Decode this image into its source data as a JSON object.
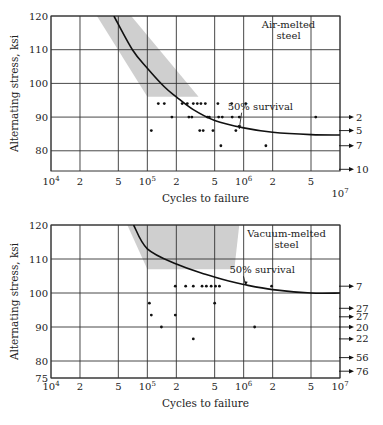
{
  "chart_data": [
    {
      "type": "scatter",
      "title": "Air-melted steel",
      "panel_label_lines": [
        "Air-melted",
        "steel"
      ],
      "xlabel": "Cycles to failure",
      "ylabel": "Alternating stress, ksi",
      "xscale": "log",
      "xlim": [
        10000,
        10000000
      ],
      "ylim": [
        74,
        120
      ],
      "x_ticks": [
        10000,
        20000,
        50000,
        100000,
        200000,
        500000,
        1000000,
        2000000,
        5000000,
        10000000
      ],
      "x_tick_labels": [
        {
          "base": "10",
          "exp": "4"
        },
        {
          "base": "2"
        },
        {
          "base": "5"
        },
        {
          "base": "10",
          "exp": "5"
        },
        {
          "base": "2"
        },
        {
          "base": "5"
        },
        {
          "base": "10",
          "exp": "6"
        },
        {
          "base": "2"
        },
        {
          "base": "5"
        },
        {
          "base": "10",
          "exp": "7"
        }
      ],
      "y_ticks": [
        80,
        90,
        100,
        110,
        120
      ],
      "grid": true,
      "scatter_band": {
        "label": "scatter band",
        "color": "#cfcfcf",
        "polygon": [
          [
            30000,
            120
          ],
          [
            68000,
            120
          ],
          [
            340000,
            96
          ],
          [
            100000,
            96
          ]
        ]
      },
      "curve": {
        "name": "50% survival",
        "points": [
          [
            45000,
            120
          ],
          [
            70000,
            110
          ],
          [
            100000,
            104.5
          ],
          [
            150000,
            99
          ],
          [
            200000,
            96
          ],
          [
            300000,
            92.2
          ],
          [
            500000,
            89
          ],
          [
            1000000,
            86.8
          ],
          [
            2000000,
            85.5
          ],
          [
            5000000,
            84.8
          ],
          [
            10000000,
            84.7
          ]
        ]
      },
      "annotation": "50% survival",
      "points": [
        [
          130000,
          94
        ],
        [
          150000,
          94
        ],
        [
          230000,
          94
        ],
        [
          260000,
          94
        ],
        [
          300000,
          94
        ],
        [
          330000,
          94
        ],
        [
          360000,
          94
        ],
        [
          400000,
          94
        ],
        [
          540000,
          94
        ],
        [
          750000,
          94
        ],
        [
          1050000,
          94
        ],
        [
          180000,
          90
        ],
        [
          270000,
          90
        ],
        [
          290000,
          90
        ],
        [
          420000,
          90
        ],
        [
          440000,
          90
        ],
        [
          550000,
          90
        ],
        [
          600000,
          90
        ],
        [
          760000,
          90
        ],
        [
          900000,
          90
        ],
        [
          5600000,
          90
        ],
        [
          110000,
          86
        ],
        [
          350000,
          86
        ],
        [
          380000,
          86
        ],
        [
          480000,
          86
        ],
        [
          830000,
          86
        ],
        [
          580000,
          81.5
        ],
        [
          1700000,
          81.5
        ]
      ],
      "runouts": [
        {
          "stress": 90,
          "count": "2"
        },
        {
          "stress": 86,
          "count": "5"
        },
        {
          "stress": 81.5,
          "count": "7"
        },
        {
          "stress": 74.5,
          "count": "10"
        }
      ]
    },
    {
      "type": "scatter",
      "title": "Vacuum-melted steel",
      "panel_label_lines": [
        "Vacuum-melted",
        "steel"
      ],
      "xlabel": "Cycles to failure",
      "ylabel": "Alternating stress, ksi",
      "xscale": "log",
      "xlim": [
        10000,
        10000000
      ],
      "ylim": [
        75,
        120
      ],
      "x_ticks": [
        10000,
        20000,
        50000,
        100000,
        200000,
        500000,
        1000000,
        2000000,
        5000000,
        10000000
      ],
      "x_tick_labels": [
        {
          "base": "10",
          "exp": "4"
        },
        {
          "base": "2"
        },
        {
          "base": "5"
        },
        {
          "base": "10",
          "exp": "5"
        },
        {
          "base": "2"
        },
        {
          "base": "5"
        },
        {
          "base": "10",
          "exp": "6"
        },
        {
          "base": "2"
        },
        {
          "base": "5"
        },
        {
          "base": "10",
          "exp": "7"
        }
      ],
      "y_ticks": [
        75,
        80,
        90,
        100,
        110,
        120
      ],
      "grid": true,
      "scatter_band": {
        "label": "scatter band",
        "color": "#cfcfcf",
        "polygon": [
          [
            62000,
            120
          ],
          [
            900000,
            120
          ],
          [
            800000,
            107
          ],
          [
            480000,
            107
          ],
          [
            100000,
            107
          ]
        ]
      },
      "curve": {
        "name": "50% survival",
        "points": [
          [
            72000,
            120
          ],
          [
            100000,
            113
          ],
          [
            200000,
            108.5
          ],
          [
            400000,
            105.5
          ],
          [
            700000,
            103.5
          ],
          [
            1000000,
            102.5
          ],
          [
            2000000,
            101
          ],
          [
            5000000,
            100
          ],
          [
            10000000,
            100
          ]
        ]
      },
      "annotation": "50% survival",
      "points": [
        [
          195000,
          102
        ],
        [
          250000,
          102
        ],
        [
          300000,
          102
        ],
        [
          370000,
          102
        ],
        [
          410000,
          102
        ],
        [
          460000,
          102
        ],
        [
          510000,
          102
        ],
        [
          560000,
          102
        ],
        [
          1950000,
          102
        ],
        [
          105000,
          97
        ],
        [
          500000,
          97
        ],
        [
          110000,
          93.5
        ],
        [
          195000,
          93.5
        ],
        [
          140000,
          90
        ],
        [
          1300000,
          90
        ],
        [
          300000,
          86.5
        ]
      ],
      "runouts": [
        {
          "stress": 102,
          "count": "7"
        },
        {
          "stress": 95.5,
          "count": "27"
        },
        {
          "stress": 93,
          "count": "27"
        },
        {
          "stress": 90,
          "count": "20"
        },
        {
          "stress": 86.5,
          "count": "22"
        },
        {
          "stress": 81,
          "count": "56"
        },
        {
          "stress": 77,
          "count": "76"
        }
      ]
    }
  ]
}
